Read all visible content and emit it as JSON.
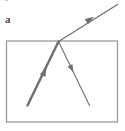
{
  "figure": {
    "panel_label": "a",
    "clipped_top_glyph": "g",
    "background_color": "#ffffff",
    "stroke_color": "#6f6f6f",
    "boundary_color": "#9a9a9a",
    "label_color": "#4a4a4a",
    "width": 125,
    "height": 131
  },
  "diagram_data": {
    "type": "ray-diagram",
    "description": "Ray striking a rectangular boundary: an incident ray travels up-right from inside the rectangle to a point on the top edge, where it splits into a transmitted ray continuing up-right outside the rectangle and a reflected ray going down-right inside the rectangle.",
    "boundary": {
      "name": "rectangle-boundary",
      "shape": "rectangle",
      "x": 6.5,
      "y": 41,
      "width": 111,
      "height": 81,
      "stroke_width": 1.3,
      "fill": "none"
    },
    "vertex": {
      "name": "incidence-point",
      "x": 58.5,
      "y": 41.5
    },
    "rays": [
      {
        "name": "incident-ray",
        "role": "incident",
        "x1": 27.5,
        "y1": 105.5,
        "x2": 58.5,
        "y2": 41.5,
        "stroke_width": 2.4,
        "arrow": {
          "at_x": 46.5,
          "at_y": 67.5,
          "size": 9,
          "position": "midpoint"
        }
      },
      {
        "name": "transmitted-ray",
        "role": "transmitted",
        "x1": 58.5,
        "y1": 41.5,
        "x2": 117.5,
        "y2": 4.5,
        "stroke_width": 1.3,
        "arrow": {
          "at_x": 94.0,
          "at_y": 16.8,
          "size": 9,
          "position": "midpoint"
        }
      },
      {
        "name": "reflected-ray",
        "role": "reflected",
        "x1": 58.5,
        "y1": 41.5,
        "x2": 89.5,
        "y2": 105.5,
        "stroke_width": 1.1,
        "arrow": {
          "at_x": 73.5,
          "at_y": 72.5,
          "size": 8,
          "position": "midpoint"
        }
      }
    ]
  }
}
